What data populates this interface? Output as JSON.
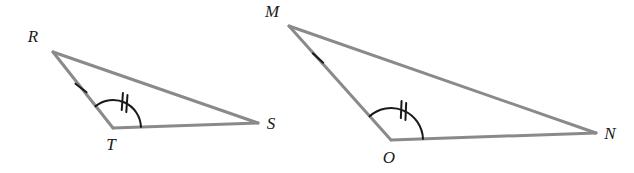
{
  "figure": {
    "kind": "geometry-diagram",
    "background_color": "#ffffff",
    "side_color": "#8a8a8a",
    "mark_color": "#1a1a1a",
    "side_width": 3,
    "mark_width": 2
  },
  "triangles": [
    {
      "id": "left",
      "name": "triangle-RTS",
      "vertices": [
        {
          "label": "R",
          "name": "vertex-R",
          "x": 53,
          "y": 52,
          "label_x": 33,
          "label_y": 38
        },
        {
          "label": "T",
          "name": "vertex-T",
          "x": 113,
          "y": 128,
          "label_x": 111,
          "label_y": 146
        },
        {
          "label": "S",
          "name": "vertex-S",
          "x": 258,
          "y": 123,
          "label_x": 271,
          "label_y": 125
        }
      ],
      "sides": [
        {
          "name": "side-RT",
          "from": "R",
          "to": "T",
          "x1": 53,
          "y1": 52,
          "x2": 113,
          "y2": 128,
          "ticks": 1
        },
        {
          "name": "side-TS",
          "from": "T",
          "to": "S",
          "x1": 113,
          "y1": 128,
          "x2": 258,
          "y2": 123,
          "ticks": 0
        },
        {
          "name": "side-RS",
          "from": "R",
          "to": "S",
          "x1": 53,
          "y1": 52,
          "x2": 258,
          "y2": 123,
          "ticks": 0
        }
      ],
      "tick_marks": [
        {
          "name": "tick-single-side-RT",
          "count": 1,
          "cx": 81,
          "cy": 88,
          "angle": -52
        }
      ],
      "angle_arcs": [
        {
          "name": "angle-arc-T",
          "at": "T",
          "cx": 113,
          "cy": 128,
          "radius": 28,
          "start_deg": 231,
          "end_deg": 358,
          "ticks": 2
        }
      ]
    },
    {
      "id": "right",
      "name": "triangle-MON",
      "vertices": [
        {
          "label": "M",
          "name": "vertex-M",
          "x": 289,
          "y": 26,
          "label_x": 272,
          "label_y": 13
        },
        {
          "label": "O",
          "name": "vertex-O",
          "x": 391,
          "y": 140,
          "label_x": 389,
          "label_y": 159
        },
        {
          "label": "N",
          "name": "vertex-N",
          "x": 596,
          "y": 133,
          "label_x": 610,
          "label_y": 135
        }
      ],
      "sides": [
        {
          "name": "side-MO",
          "from": "M",
          "to": "O",
          "x1": 289,
          "y1": 26,
          "x2": 391,
          "y2": 140,
          "ticks": 1
        },
        {
          "name": "side-ON",
          "from": "O",
          "to": "N",
          "x1": 391,
          "y1": 140,
          "x2": 596,
          "y2": 133,
          "ticks": 0
        },
        {
          "name": "side-MN",
          "from": "M",
          "to": "N",
          "x1": 289,
          "y1": 26,
          "x2": 596,
          "y2": 133,
          "ticks": 0
        }
      ],
      "tick_marks": [
        {
          "name": "tick-single-side-MO",
          "count": 1,
          "cx": 318,
          "cy": 58,
          "angle": -48
        }
      ],
      "angle_arcs": [
        {
          "name": "angle-arc-O",
          "at": "O",
          "cx": 391,
          "cy": 140,
          "radius": 32,
          "start_deg": 228,
          "end_deg": 358,
          "ticks": 2
        }
      ]
    }
  ]
}
